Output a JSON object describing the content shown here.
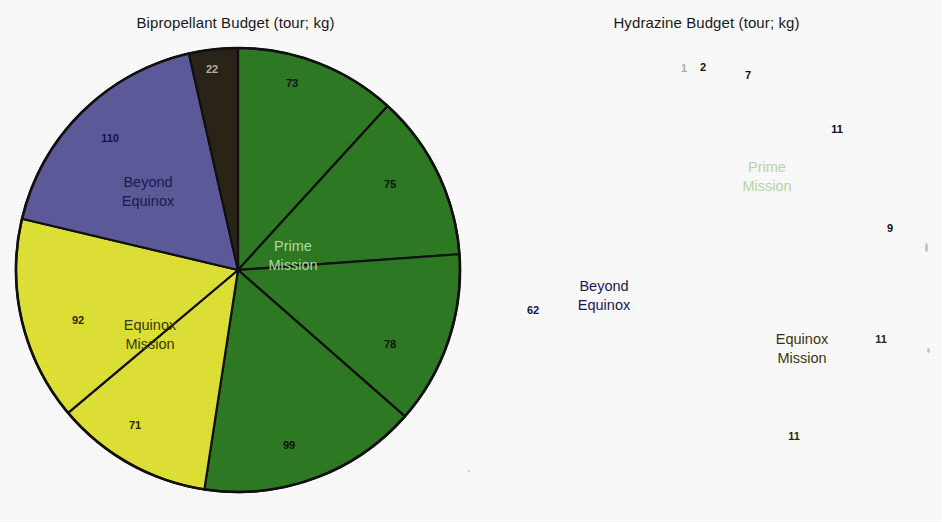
{
  "figure": {
    "background": "#ffffff",
    "palette": {
      "prime_green": "#2f7c23",
      "equinox_yellow": "#e2e536",
      "beyond_purple": "#5e5c9d",
      "dark_slice": "#2b2419",
      "outline": "#111111",
      "prime_text": "#b9dcab",
      "equinox_text": "#3a3a10",
      "beyond_text": "#1b1b52",
      "title_text": "#1a1a1a"
    }
  },
  "chart_data": [
    {
      "type": "pie",
      "id": "bipropellant",
      "title": "Bipropellant Budget (tour; kg)",
      "unit": "kg",
      "total": 620,
      "start_angle_deg": 0,
      "direction": "clockwise",
      "legend": "in-slice category labels",
      "group_labels": [
        {
          "text": "Prime Mission",
          "color": "#b9dcab"
        },
        {
          "text": "Equinox Mission",
          "color": "#3a3a10"
        },
        {
          "text": "Beyond Equinox",
          "color": "#1b1b52"
        }
      ],
      "categories": [
        "Prime Mission",
        "Prime Mission",
        "Prime Mission",
        "Prime Mission",
        "Equinox Mission",
        "Equinox Mission",
        "Beyond Equinox",
        "Reserve"
      ],
      "values": [
        73,
        75,
        78,
        99,
        71,
        92,
        110,
        22
      ],
      "labels": [
        "73",
        "75",
        "78",
        "99",
        "71",
        "92",
        "110",
        "22"
      ],
      "slice_colors": [
        "#2f7c23",
        "#2f7c23",
        "#2f7c23",
        "#2f7c23",
        "#e2e536",
        "#e2e536",
        "#5e5c9d",
        "#2b2419"
      ],
      "label_colors": [
        "#111111",
        "#111111",
        "#111111",
        "#111111",
        "#2a2a08",
        "#2a2a08",
        "#15154a",
        "#b8b2a4"
      ]
    },
    {
      "type": "pie",
      "id": "hydrazine",
      "title": "Hydrazine Budget (tour; kg)",
      "unit": "kg",
      "total": 114,
      "start_angle_deg": 0,
      "direction": "clockwise",
      "legend": "in-slice category labels",
      "group_labels": [
        {
          "text": "Prime Mission",
          "color": "#b9dcab"
        },
        {
          "text": "Equinox Mission",
          "color": "#3a3a10"
        },
        {
          "text": "Beyond Equinox",
          "color": "#1b1b52"
        }
      ],
      "categories": [
        "Reserve",
        "Prime Mission",
        "Prime Mission",
        "Prime Mission",
        "Prime Mission",
        "Equinox Mission",
        "Equinox Mission",
        "Beyond Equinox"
      ],
      "values": [
        1,
        2,
        7,
        11,
        9,
        11,
        11,
        62
      ],
      "labels": [
        "1",
        "2",
        "7",
        "11",
        "9",
        "11",
        "11",
        "62"
      ],
      "slice_colors": [
        "#2b2419",
        "#2f7c23",
        "#2f7c23",
        "#2f7c23",
        "#2f7c23",
        "#e2e536",
        "#e2e536",
        "#5e5c9d"
      ],
      "label_colors": [
        "#b8b2a4",
        "#111111",
        "#111111",
        "#111111",
        "#111111",
        "#2a2a08",
        "#2a2a08",
        "#15154a"
      ]
    }
  ],
  "left": {
    "title": "Bipropellant Budget (tour; kg)",
    "slices": [
      {
        "value": "73",
        "x": 292,
        "y": 84,
        "fill": "#2f7c23",
        "text": "#111111"
      },
      {
        "value": "75",
        "x": 390,
        "y": 185,
        "fill": "#2f7c23",
        "text": "#111111"
      },
      {
        "value": "78",
        "x": 390,
        "y": 345,
        "fill": "#2f7c23",
        "text": "#111111"
      },
      {
        "value": "99",
        "x": 289,
        "y": 446,
        "fill": "#2f7c23",
        "text": "#111111"
      },
      {
        "value": "71",
        "x": 135,
        "y": 426,
        "fill": "#e2e536",
        "text": "#2a2a08"
      },
      {
        "value": "92",
        "x": 78,
        "y": 321,
        "fill": "#e2e536",
        "text": "#2a2a08"
      },
      {
        "value": "110",
        "x": 110,
        "y": 139,
        "fill": "#5e5c9d",
        "text": "#15154a"
      },
      {
        "value": "22",
        "x": 212,
        "y": 70,
        "fill": "#2b2419",
        "text": "#b8b2a4"
      }
    ],
    "group_labels": [
      {
        "line1": "Prime",
        "line2": "Mission",
        "x": 293,
        "y": 247,
        "color": "#b9dcab"
      },
      {
        "line1": "Equinox",
        "line2": "Mission",
        "x": 150,
        "y": 326,
        "color": "#3a3a10"
      },
      {
        "line1": "Beyond",
        "line2": "Equinox",
        "x": 148,
        "y": 183,
        "color": "#1b1b52"
      }
    ]
  },
  "right": {
    "title": "Hydrazine Budget (tour; kg)",
    "slices": [
      {
        "value": "1",
        "x": 684,
        "y": 69,
        "fill": "#2b2419",
        "text": "#b8b2a4"
      },
      {
        "value": "2",
        "x": 703,
        "y": 68,
        "fill": "#2f7c23",
        "text": "#111111"
      },
      {
        "value": "7",
        "x": 748,
        "y": 76,
        "fill": "#2f7c23",
        "text": "#111111"
      },
      {
        "value": "11",
        "x": 837,
        "y": 130,
        "fill": "#2f7c23",
        "text": "#111111"
      },
      {
        "value": "9",
        "x": 890,
        "y": 229,
        "fill": "#2f7c23",
        "text": "#111111"
      },
      {
        "value": "11",
        "x": 881,
        "y": 340,
        "fill": "#e2e536",
        "text": "#2a2a08"
      },
      {
        "value": "11",
        "x": 794,
        "y": 437,
        "fill": "#e2e536",
        "text": "#2a2a08"
      },
      {
        "value": "62",
        "x": 533,
        "y": 311,
        "fill": "#5e5c9d",
        "text": "#15154a"
      }
    ],
    "group_labels": [
      {
        "line1": "Prime",
        "line2": "Mission",
        "x": 767,
        "y": 168,
        "color": "#b9dcab"
      },
      {
        "line1": "Equinox",
        "line2": "Mission",
        "x": 802,
        "y": 340,
        "color": "#3a3a10"
      },
      {
        "line1": "Beyond",
        "line2": "Equinox",
        "x": 604,
        "y": 287,
        "color": "#1b1b52"
      }
    ]
  }
}
